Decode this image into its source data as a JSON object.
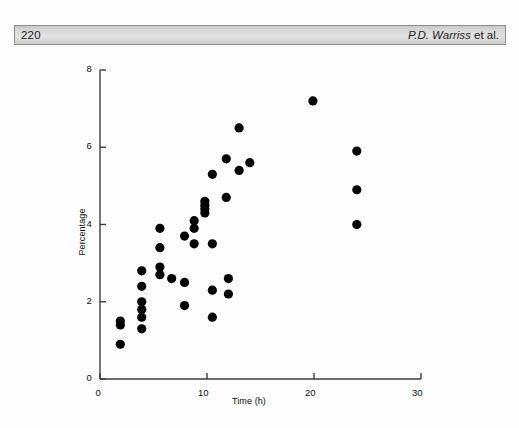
{
  "header": {
    "page_number": "220",
    "author_names": "P.D. Warriss",
    "author_suffix": " et al."
  },
  "figure": {
    "x_axis_title": "Time (h)",
    "y_axis_title": "Percentage",
    "x_tick_labels": [
      "0",
      "10",
      "20",
      "30"
    ],
    "y_tick_labels": [
      "0",
      "2",
      "4",
      "6",
      "8"
    ],
    "marker_color": "#000000",
    "axis_color": "#3b3b3b"
  },
  "chart_data": {
    "type": "scatter",
    "title": "",
    "xlabel": "Time (h)",
    "ylabel": "Percentage",
    "xlim": [
      0,
      30
    ],
    "ylim": [
      0,
      8
    ],
    "xticks": [
      0,
      10,
      20,
      30
    ],
    "yticks": [
      0,
      2,
      4,
      6,
      8
    ],
    "grid": false,
    "legend": false,
    "series": [
      {
        "name": "Percentage vs Time",
        "points": [
          [
            1.9,
            1.5
          ],
          [
            1.9,
            1.4
          ],
          [
            1.9,
            0.9
          ],
          [
            3.9,
            2.8
          ],
          [
            3.9,
            2.4
          ],
          [
            3.9,
            2.0
          ],
          [
            3.9,
            1.8
          ],
          [
            3.9,
            1.6
          ],
          [
            3.9,
            1.3
          ],
          [
            5.6,
            3.9
          ],
          [
            5.6,
            3.4
          ],
          [
            5.6,
            2.9
          ],
          [
            5.6,
            2.7
          ],
          [
            6.7,
            2.6
          ],
          [
            7.9,
            3.7
          ],
          [
            7.9,
            2.5
          ],
          [
            7.9,
            1.9
          ],
          [
            8.8,
            4.1
          ],
          [
            8.8,
            3.9
          ],
          [
            8.8,
            3.5
          ],
          [
            9.8,
            4.6
          ],
          [
            9.8,
            4.5
          ],
          [
            9.8,
            4.4
          ],
          [
            9.8,
            4.3
          ],
          [
            10.5,
            5.3
          ],
          [
            10.5,
            3.5
          ],
          [
            10.5,
            2.3
          ],
          [
            10.5,
            1.6
          ],
          [
            11.8,
            5.7
          ],
          [
            11.8,
            4.7
          ],
          [
            12.0,
            2.6
          ],
          [
            12.0,
            2.2
          ],
          [
            13.0,
            6.5
          ],
          [
            13.0,
            5.4
          ],
          [
            14.0,
            5.6
          ],
          [
            19.9,
            7.2
          ],
          [
            24.0,
            5.9
          ],
          [
            24.0,
            4.9
          ],
          [
            24.0,
            4.0
          ]
        ]
      }
    ]
  }
}
